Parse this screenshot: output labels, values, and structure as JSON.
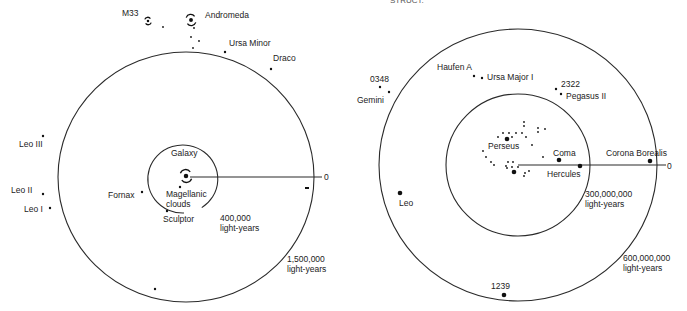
{
  "header_cutoff_text": "STRUCT.",
  "left_diagram": {
    "title": "Local Group",
    "center": [
      186,
      177
    ],
    "rings": [
      {
        "name": "inner-ring-400k",
        "rx": 35,
        "ry": 34,
        "open_arc": true,
        "label_lines": [
          "400,000",
          "light-years"
        ],
        "label_pos": [
          220,
          221
        ]
      },
      {
        "name": "outer-ring-1.5m",
        "rx": 128,
        "ry": 125,
        "open_arc": false,
        "label_lines": [
          "1,500,000",
          "light-years"
        ],
        "label_pos": [
          287,
          262
        ]
      }
    ],
    "axis": {
      "from": [
        190,
        177
      ],
      "to": [
        322,
        177
      ],
      "end_label": "0",
      "end_label_pos": [
        324,
        180
      ]
    },
    "galaxy_center": {
      "label": "Galaxy",
      "label_pos": [
        171,
        156
      ],
      "icon_pos": [
        186,
        176
      ]
    },
    "objects": [
      {
        "name": "M33",
        "label": "M33",
        "x": 148,
        "y": 21,
        "label_x": 122,
        "label_y": 16,
        "kind": "spiral-small"
      },
      {
        "name": "Andromeda",
        "label": "Andromeda",
        "x": 191,
        "y": 20,
        "label_x": 205,
        "label_y": 18,
        "kind": "spiral"
      },
      {
        "name": "Ursa Minor",
        "label": "Ursa Minor",
        "x": 225,
        "y": 52,
        "label_x": 229,
        "label_y": 46
      },
      {
        "name": "Draco",
        "label": "Draco",
        "x": 271,
        "y": 69,
        "label_x": 273,
        "label_y": 61
      },
      {
        "name": "Leo III",
        "label": "Leo III",
        "x": 43,
        "y": 136,
        "label_x": 19,
        "label_y": 147
      },
      {
        "name": "Leo II",
        "label": "Leo II",
        "x": 43,
        "y": 194,
        "label_x": 11,
        "label_y": 193
      },
      {
        "name": "Leo I",
        "label": "Leo I",
        "x": 50,
        "y": 208,
        "label_x": 24,
        "label_y": 212
      },
      {
        "name": "Fornax",
        "label": "Fornax",
        "x": 142,
        "y": 192,
        "label_x": 108,
        "label_y": 198
      },
      {
        "name": "Magellanic clouds",
        "label_lines": [
          "Magellanic",
          "clouds"
        ],
        "x": 180,
        "y": 187,
        "label_x": 166,
        "label_y": 197
      },
      {
        "name": "Sculptor",
        "label": "Sculptor",
        "x": 167,
        "y": 211,
        "label_x": 163,
        "label_y": 222
      },
      {
        "name": "unnamed-bottom",
        "label": "",
        "x": 155,
        "y": 289
      },
      {
        "name": "unnamed-right",
        "label": "",
        "x": 307,
        "y": 188,
        "kind": "dash"
      }
    ],
    "minor_dots": [
      [
        163,
        27
      ],
      [
        194,
        28
      ],
      [
        191,
        37
      ],
      [
        199,
        41
      ],
      [
        193,
        48
      ]
    ]
  },
  "right_diagram": {
    "title": "Nearby Clusters",
    "center": [
      518,
      165
    ],
    "rings": [
      {
        "name": "inner-ring-300m",
        "rx": 72,
        "ry": 71,
        "label_lines": [
          "300,000,000",
          "light-years"
        ],
        "label_pos": [
          585,
          197
        ]
      },
      {
        "name": "outer-ring-600m",
        "rx": 139,
        "ry": 136,
        "label_lines": [
          "600,000,000",
          "light-years"
        ],
        "label_pos": [
          623,
          261
        ]
      }
    ],
    "axis": {
      "from": [
        518,
        165
      ],
      "to": [
        666,
        165
      ],
      "end_label": "0",
      "end_label_pos": [
        667,
        169
      ]
    },
    "objects": [
      {
        "name": "Haufen A",
        "label": "Haufen A",
        "x": 474,
        "y": 76,
        "label_x": 437,
        "label_y": 70
      },
      {
        "name": "Ursa Major I",
        "label": "Ursa Major I",
        "x": 482,
        "y": 78,
        "label_x": 487,
        "label_y": 80
      },
      {
        "name": "0348",
        "label": "0348",
        "x": 380,
        "y": 87,
        "label_x": 370,
        "label_y": 82
      },
      {
        "name": "Gemini",
        "label": "Gemini",
        "x": 389,
        "y": 92,
        "label_x": 357,
        "label_y": 103
      },
      {
        "name": "2322",
        "label": "2322",
        "x": 556,
        "y": 89,
        "label_x": 561,
        "label_y": 87
      },
      {
        "name": "Pegasus II",
        "label": "Pegasus II",
        "x": 561,
        "y": 94,
        "label_x": 566,
        "label_y": 99
      },
      {
        "name": "Perseus",
        "label": "Perseus",
        "x": 507,
        "y": 139,
        "label_x": 488,
        "label_y": 149,
        "big": true
      },
      {
        "name": "Coma",
        "label": "Coma",
        "x": 559,
        "y": 160,
        "label_x": 553,
        "label_y": 156,
        "big": true
      },
      {
        "name": "Hercules",
        "label": "Hercules",
        "x": 580,
        "y": 166,
        "label_x": 547,
        "label_y": 177,
        "big": true
      },
      {
        "name": "Corona Borealis",
        "label": "Corona Borealis",
        "x": 650,
        "y": 161,
        "label_x": 606,
        "label_y": 156,
        "big": true
      },
      {
        "name": "Leo",
        "label": "Leo",
        "x": 400,
        "y": 193,
        "label_x": 399,
        "label_y": 206,
        "big": true
      },
      {
        "name": "1239",
        "label": "1239",
        "x": 504,
        "y": 295,
        "label_x": 491,
        "label_y": 289,
        "big": true
      },
      {
        "name": "cluster-center",
        "label": "",
        "x": 514,
        "y": 172,
        "big": true
      }
    ],
    "minor_dots": [
      [
        524,
        122
      ],
      [
        524,
        126
      ],
      [
        538,
        128
      ],
      [
        538,
        132
      ],
      [
        545,
        129
      ],
      [
        503,
        133
      ],
      [
        509,
        133
      ],
      [
        516,
        133
      ],
      [
        522,
        133
      ],
      [
        526,
        137
      ],
      [
        498,
        137
      ],
      [
        512,
        137
      ],
      [
        532,
        145
      ],
      [
        483,
        151
      ],
      [
        486,
        157
      ],
      [
        491,
        162
      ],
      [
        494,
        165
      ],
      [
        543,
        157
      ],
      [
        508,
        162
      ],
      [
        513,
        162
      ],
      [
        506,
        166
      ],
      [
        512,
        167
      ],
      [
        507,
        168
      ],
      [
        518,
        167
      ],
      [
        529,
        171
      ],
      [
        525,
        173
      ],
      [
        524,
        176
      ]
    ]
  }
}
